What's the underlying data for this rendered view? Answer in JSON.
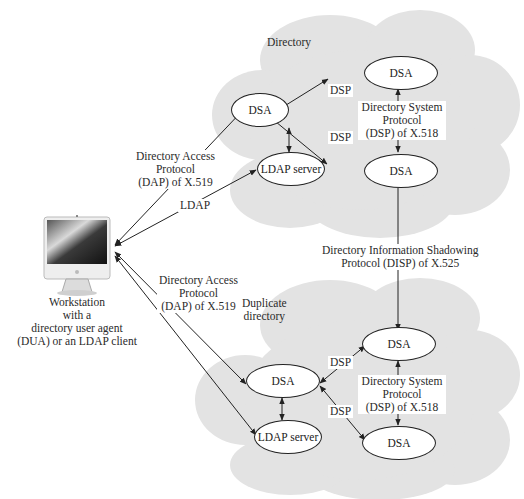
{
  "diagram": {
    "colors": {
      "cloud": "#e3e3e3",
      "cloud_edge": "#d6d6d6",
      "line": "#222222",
      "node_fill": "#ffffff"
    },
    "workstation": {
      "icon": "desktop-computer-icon",
      "label_lines": [
        "Workstation",
        "with a",
        "directory user agent",
        "(DUA) or an LDAP client"
      ]
    },
    "directory": {
      "title": "Directory",
      "nodes": {
        "dsa_main": "DSA",
        "dsa_top": "DSA",
        "dsa_bottom": "DSA",
        "ldap_server": "LDAP server"
      },
      "dsp_labels": [
        "DSP",
        "DSP"
      ],
      "dsp_protocol_lines": [
        "Directory System",
        "Protocol",
        "(DSP) of X.518"
      ]
    },
    "duplicate_directory": {
      "title_lines": [
        "Duplicate",
        "directory"
      ],
      "nodes": {
        "dsa_main": "DSA",
        "dsa_top": "DSA",
        "dsa_bottom": "DSA",
        "ldap_server": "LDAP server"
      },
      "dsp_labels": [
        "DSP",
        "DSP"
      ],
      "dsp_protocol_lines": [
        "Directory System",
        "Protocol",
        "(DSP) of X.518"
      ]
    },
    "connections": {
      "dap_top_lines": [
        "Directory Access",
        "Protocol",
        "(DAP) of X.519"
      ],
      "ldap": "LDAP",
      "dap_bottom_lines": [
        "Directory Access",
        "Protocol",
        "(DAP) of X.519"
      ],
      "disp_lines": [
        "Directory Information Shadowing",
        "Protocol (DISP) of X.525"
      ]
    }
  }
}
